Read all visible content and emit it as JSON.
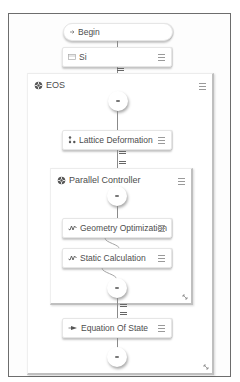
{
  "workflow": {
    "begin": {
      "label": "Begin",
      "icon": "begin-arrow-icon"
    },
    "si": {
      "label": "Si",
      "icon": "structure-icon",
      "menu_icon": "hamburger-menu-icon"
    },
    "eos": {
      "label": "EOS",
      "icon": "loop-controller-icon",
      "menu_icon": "hamburger-menu-icon",
      "resize_icon": "resize-handle-icon",
      "children": {
        "lattice_deformation": {
          "label": "Lattice Deformation",
          "icon": "lattice-nodes-icon"
        },
        "parallel_controller": {
          "label": "Parallel Controller",
          "icon": "parallel-controller-icon",
          "children": {
            "geometry_optimization": {
              "label": "Geometry Optimization",
              "icon": "waveform-icon"
            },
            "static_calculation": {
              "label": "Static Calculation",
              "icon": "waveform-icon"
            }
          }
        },
        "equation_of_state": {
          "label": "Equation Of State",
          "icon": "eos-fit-icon"
        }
      }
    }
  },
  "colors": {
    "frame_border": "#6d6d6d",
    "node_bg": "#ffffff",
    "text": "#4d4d4d",
    "connector": "#8a8a8a"
  }
}
